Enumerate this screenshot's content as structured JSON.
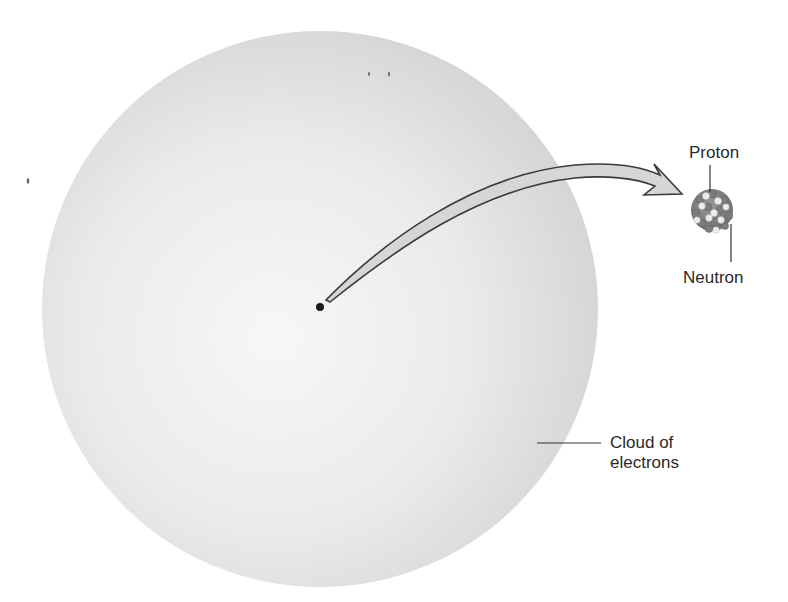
{
  "figure": {
    "labels": {
      "proton": "Proton",
      "neutron": "Neutron",
      "cloud_line1": "Cloud of",
      "cloud_line2": "electrons"
    },
    "colors": {
      "cloud_light": "#f6f6f6",
      "cloud_dark": "#d4d4d4",
      "arrow_fill": "#d6d6d6",
      "arrow_stroke": "#3a3a3a",
      "nucleus_dot": "#1a1a1a",
      "proton_color": "#8a8a8a",
      "neutron_color": "#e4e4e4",
      "leader_line": "#333333"
    },
    "elements": {
      "electron_cloud": {
        "cx": 320,
        "cy": 309,
        "r": 278
      },
      "nucleus_dot": {
        "cx": 320,
        "cy": 307,
        "r": 4
      },
      "nucleus_enlarged": {
        "cx": 712,
        "cy": 210,
        "r": 22
      }
    }
  }
}
